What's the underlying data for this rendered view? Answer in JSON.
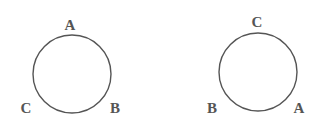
{
  "diagrams": [
    {
      "circle": {
        "cx": 72,
        "cy": 74,
        "r": 39
      },
      "labels": [
        {
          "text": "A",
          "x": 70,
          "y": 30
        },
        {
          "text": "C",
          "x": 26,
          "y": 113
        },
        {
          "text": "B",
          "x": 115,
          "y": 113
        }
      ]
    },
    {
      "circle": {
        "cx": 258,
        "cy": 72,
        "r": 39
      },
      "labels": [
        {
          "text": "C",
          "x": 257,
          "y": 27
        },
        {
          "text": "B",
          "x": 212,
          "y": 113
        },
        {
          "text": "A",
          "x": 299,
          "y": 113
        }
      ]
    }
  ],
  "colors": {
    "stroke": "#555555",
    "text": "#555555",
    "background": "#ffffff"
  }
}
